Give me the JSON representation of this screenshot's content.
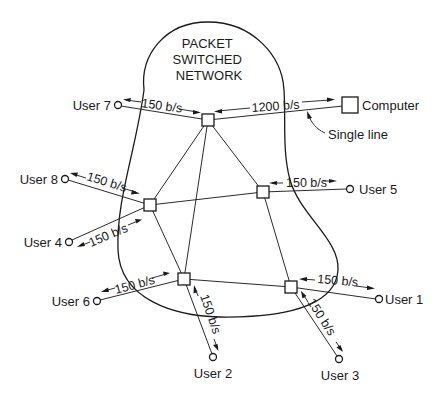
{
  "network": {
    "title_lines": [
      "PACKET",
      "SWITCHED",
      "NETWORK"
    ]
  },
  "computer": {
    "label": "Computer",
    "rate": "1200 b/s"
  },
  "annotation": {
    "single_line": "Single line"
  },
  "users": [
    {
      "id": "user7",
      "label": "User 7",
      "rate": "150 b/s"
    },
    {
      "id": "user8",
      "label": "User 8",
      "rate": "150 b/s"
    },
    {
      "id": "user5",
      "label": "User 5",
      "rate": "150 b/s"
    },
    {
      "id": "user4",
      "label": "User 4",
      "rate": "150 b/s"
    },
    {
      "id": "user6",
      "label": "User 6",
      "rate": "150 b/s"
    },
    {
      "id": "user1",
      "label": "User 1",
      "rate": "150 b/s"
    },
    {
      "id": "user2",
      "label": "User 2",
      "rate": "150 b/s"
    },
    {
      "id": "user3",
      "label": "User 3",
      "rate": "150 b/s"
    }
  ],
  "switching_nodes": [
    "top",
    "left",
    "right",
    "bottom-left",
    "bottom-right"
  ],
  "colors": {
    "line": "#1a1a1a",
    "background": "#ffffff"
  }
}
